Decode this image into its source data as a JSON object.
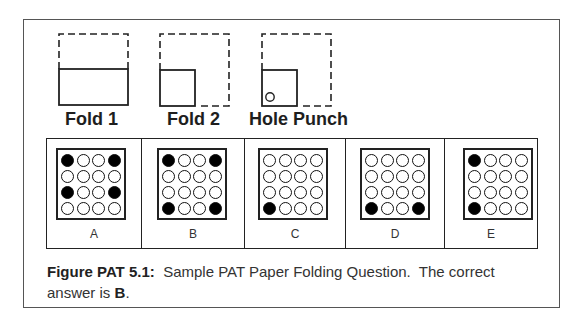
{
  "figure": {
    "steps": [
      {
        "label": "Fold 1",
        "icon": "fold-1-diagram"
      },
      {
        "label": "Fold 2",
        "icon": "fold-2-diagram"
      },
      {
        "label": "Hole Punch",
        "icon": "hole-punch-diagram"
      }
    ],
    "answers": [
      {
        "letter": "A",
        "filled": [
          0,
          3,
          8,
          11
        ]
      },
      {
        "letter": "B",
        "filled": [
          0,
          3,
          12,
          15
        ]
      },
      {
        "letter": "C",
        "filled": [
          12
        ]
      },
      {
        "letter": "D",
        "filled": [
          12,
          15
        ]
      },
      {
        "letter": "E",
        "filled": [
          0,
          12
        ]
      }
    ],
    "grid": {
      "rows": 4,
      "cols": 4
    }
  },
  "caption": {
    "label": "Figure PAT 5.1:",
    "text": "  Sample PAT Paper Folding Question.  The correct answer is ",
    "answer": "B",
    "end": "."
  },
  "colors": {
    "line": "#222222",
    "frame": "#555555",
    "text": "#333333"
  }
}
